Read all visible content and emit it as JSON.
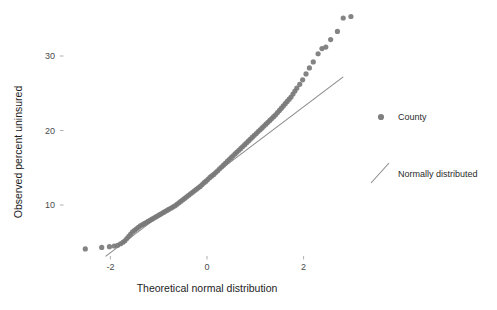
{
  "chart_data": {
    "type": "scatter",
    "title": "",
    "subtitle": "",
    "xlabel": "Theoretical normal distribution",
    "ylabel": "Observed percent uninsured",
    "xlim": [
      -2.65,
      3.05
    ],
    "ylim": [
      2.5,
      36.5
    ],
    "xticks": [
      -2,
      0,
      2
    ],
    "xtick_labels": [
      "-2",
      "0",
      "2"
    ],
    "yticks": [
      10,
      20,
      30
    ],
    "ytick_labels": [
      "10",
      "20",
      "30"
    ],
    "grid": false,
    "legend_position": "right",
    "legend": [
      {
        "name": "County",
        "marker": "circle",
        "color": "#808080"
      },
      {
        "name": "Normally distributed",
        "marker": "line",
        "color": "#8c8c8c"
      }
    ],
    "series": [
      {
        "name": "County",
        "type": "scatter",
        "marker": "circle",
        "color": "#7a7a7a",
        "points": [
          [
            -2.52,
            4.1
          ],
          [
            -2.18,
            4.3
          ],
          [
            -2.02,
            4.4
          ],
          [
            -1.92,
            4.5
          ],
          [
            -1.85,
            4.6
          ],
          [
            -1.79,
            4.8
          ],
          [
            -1.74,
            5.0
          ],
          [
            -1.7,
            5.2
          ],
          [
            -1.66,
            5.5
          ],
          [
            -1.62,
            5.8
          ],
          [
            -1.58,
            6.1
          ],
          [
            -1.54,
            6.4
          ],
          [
            -1.5,
            6.6
          ],
          [
            -1.46,
            6.8
          ],
          [
            -1.42,
            7.0
          ],
          [
            -1.38,
            7.2
          ],
          [
            -1.34,
            7.35
          ],
          [
            -1.3,
            7.5
          ],
          [
            -1.26,
            7.65
          ],
          [
            -1.22,
            7.8
          ],
          [
            -1.18,
            7.95
          ],
          [
            -1.14,
            8.1
          ],
          [
            -1.1,
            8.25
          ],
          [
            -1.06,
            8.4
          ],
          [
            -1.02,
            8.55
          ],
          [
            -0.98,
            8.7
          ],
          [
            -0.94,
            8.85
          ],
          [
            -0.9,
            9.0
          ],
          [
            -0.86,
            9.15
          ],
          [
            -0.82,
            9.3
          ],
          [
            -0.78,
            9.45
          ],
          [
            -0.74,
            9.6
          ],
          [
            -0.7,
            9.75
          ],
          [
            -0.66,
            9.9
          ],
          [
            -0.62,
            10.1
          ],
          [
            -0.58,
            10.3
          ],
          [
            -0.54,
            10.5
          ],
          [
            -0.5,
            10.7
          ],
          [
            -0.46,
            10.9
          ],
          [
            -0.42,
            11.1
          ],
          [
            -0.38,
            11.3
          ],
          [
            -0.34,
            11.5
          ],
          [
            -0.3,
            11.7
          ],
          [
            -0.26,
            11.9
          ],
          [
            -0.22,
            12.1
          ],
          [
            -0.18,
            12.3
          ],
          [
            -0.14,
            12.5
          ],
          [
            -0.1,
            12.75
          ],
          [
            -0.06,
            13.0
          ],
          [
            -0.02,
            13.2
          ],
          [
            0.02,
            13.45
          ],
          [
            0.06,
            13.7
          ],
          [
            0.1,
            13.9
          ],
          [
            0.14,
            14.1
          ],
          [
            0.18,
            14.35
          ],
          [
            0.22,
            14.6
          ],
          [
            0.26,
            14.85
          ],
          [
            0.3,
            15.1
          ],
          [
            0.34,
            15.35
          ],
          [
            0.38,
            15.6
          ],
          [
            0.42,
            15.85
          ],
          [
            0.46,
            16.1
          ],
          [
            0.5,
            16.35
          ],
          [
            0.54,
            16.6
          ],
          [
            0.58,
            16.85
          ],
          [
            0.62,
            17.1
          ],
          [
            0.66,
            17.35
          ],
          [
            0.7,
            17.6
          ],
          [
            0.74,
            17.85
          ],
          [
            0.78,
            18.1
          ],
          [
            0.82,
            18.35
          ],
          [
            0.86,
            18.6
          ],
          [
            0.9,
            18.85
          ],
          [
            0.94,
            19.1
          ],
          [
            0.98,
            19.35
          ],
          [
            1.02,
            19.6
          ],
          [
            1.06,
            19.85
          ],
          [
            1.1,
            20.1
          ],
          [
            1.14,
            20.35
          ],
          [
            1.18,
            20.6
          ],
          [
            1.22,
            20.85
          ],
          [
            1.26,
            21.1
          ],
          [
            1.3,
            21.35
          ],
          [
            1.34,
            21.6
          ],
          [
            1.38,
            21.85
          ],
          [
            1.42,
            22.1
          ],
          [
            1.46,
            22.4
          ],
          [
            1.5,
            22.7
          ],
          [
            1.54,
            23.0
          ],
          [
            1.58,
            23.3
          ],
          [
            1.62,
            23.6
          ],
          [
            1.66,
            23.9
          ],
          [
            1.7,
            24.2
          ],
          [
            1.74,
            24.5
          ],
          [
            1.78,
            24.9
          ],
          [
            1.82,
            25.3
          ],
          [
            1.86,
            25.7
          ],
          [
            1.92,
            26.2
          ],
          [
            1.98,
            26.8
          ],
          [
            2.05,
            27.6
          ],
          [
            2.12,
            28.4
          ],
          [
            2.2,
            29.2
          ],
          [
            2.3,
            30.3
          ],
          [
            2.38,
            31.0
          ],
          [
            2.46,
            31.2
          ],
          [
            2.56,
            32.2
          ],
          [
            2.7,
            33.3
          ],
          [
            2.82,
            35.1
          ],
          [
            2.98,
            35.3
          ]
        ]
      },
      {
        "name": "Normally distributed",
        "type": "line",
        "color": "#8c8c8c",
        "x": [
          -2.1,
          2.82
        ],
        "y": [
          3.1,
          27.2
        ]
      }
    ]
  }
}
